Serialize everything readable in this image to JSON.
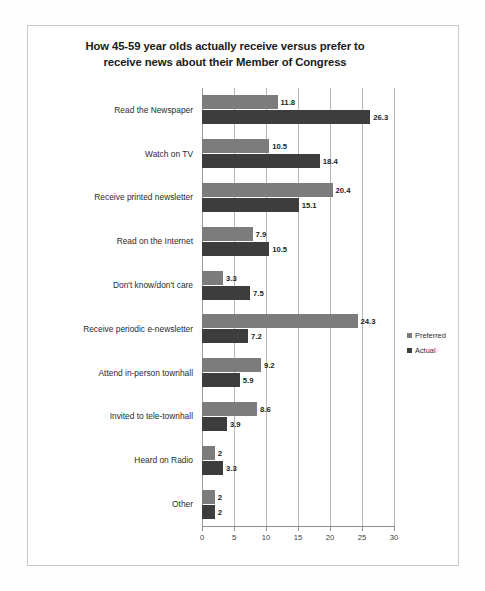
{
  "chart_data": {
    "type": "bar",
    "orientation": "horizontal",
    "title": "How 45-59 year olds actually receive versus prefer to receive news about their Member of Congress",
    "title_lines": [
      "How 45-59 year olds actually receive versus prefer to",
      "receive news about their Member of Congress"
    ],
    "xlabel": "",
    "ylabel": "",
    "xlim": [
      0,
      30
    ],
    "xticks": [
      0,
      5,
      10,
      15,
      20,
      25,
      30
    ],
    "xtick_labels": [
      "0",
      "5",
      "10",
      "15",
      "20",
      "25",
      "30"
    ],
    "grid": true,
    "grid_axis": "x",
    "legend_position": "right",
    "categories": [
      "Read the Newspaper",
      "Watch on TV",
      "Receive printed newsletter",
      "Read on the Internet",
      "Don't know/don't care",
      "Receive periodic e-newsletter",
      "Attend in-person townhall",
      "Invited to tele-townhall",
      "Heard on Radio",
      "Other"
    ],
    "series": [
      {
        "name": "Preferred",
        "color": "#7c7c7c",
        "values": [
          11.8,
          10.5,
          20.4,
          7.9,
          3.3,
          24.3,
          9.2,
          8.6,
          2,
          2
        ],
        "labels": [
          "11.8",
          "10.5",
          "20.4",
          "7.9",
          "3.3",
          "24.3",
          "9.2",
          "8.6",
          "2",
          "2"
        ]
      },
      {
        "name": "Actual",
        "color": "#3d3d3d",
        "values": [
          26.3,
          18.4,
          15.1,
          10.5,
          7.5,
          7.2,
          5.9,
          3.9,
          3.3,
          2
        ],
        "labels": [
          "26.3",
          "18.4",
          "15.1",
          "10.5",
          "7.5",
          "7.2",
          "5.9",
          "3.9",
          "3.3",
          "2"
        ]
      }
    ]
  }
}
